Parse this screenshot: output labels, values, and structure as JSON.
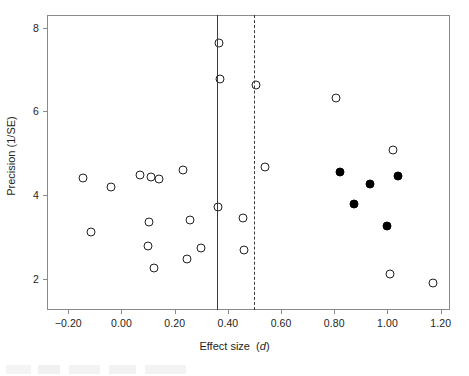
{
  "figure": {
    "kind": "funnel-plot",
    "axis_color": "#8a8a8a",
    "marker_color": "#231f20",
    "filled_marker_color": "#000000"
  },
  "chart_data": {
    "type": "scatter",
    "title": "",
    "xlabel": "Effect size (d)",
    "xlabel_plain": "Effect size",
    "xlabel_italic": "d",
    "ylabel": "Precision (1/SE)",
    "xlim": [
      -0.28,
      1.235
    ],
    "ylim": [
      1.25,
      8.3
    ],
    "xticks": [
      -0.2,
      0.0,
      0.2,
      0.4,
      0.6,
      0.8,
      1.0,
      1.2
    ],
    "xticklabels": [
      "−0.20",
      "0.00",
      "0.20",
      "0.40",
      "0.60",
      "0.80",
      "1.00",
      "1.20"
    ],
    "yticks": [
      2,
      4,
      6,
      8
    ],
    "yticklabels": [
      "2",
      "4",
      "6",
      "8"
    ],
    "grid": false,
    "legend": false,
    "reference_lines": [
      {
        "name": "observed-mean-line",
        "x": 0.36,
        "style": "solid"
      },
      {
        "name": "adjusted-mean-line",
        "x": 0.5,
        "style": "dashed"
      }
    ],
    "series": [
      {
        "name": "Observed studies",
        "marker": "open-circle",
        "points": [
          [
            -0.145,
            4.4
          ],
          [
            -0.115,
            3.11
          ],
          [
            -0.04,
            4.19
          ],
          [
            0.07,
            4.48
          ],
          [
            0.112,
            4.44
          ],
          [
            0.14,
            4.37
          ],
          [
            0.105,
            3.36
          ],
          [
            0.1,
            2.79
          ],
          [
            0.122,
            2.25
          ],
          [
            0.23,
            4.59
          ],
          [
            0.258,
            3.4
          ],
          [
            0.248,
            2.47
          ],
          [
            0.3,
            2.74
          ],
          [
            0.365,
            7.62
          ],
          [
            0.372,
            6.78
          ],
          [
            0.362,
            3.72
          ],
          [
            0.455,
            3.44
          ],
          [
            0.46,
            2.68
          ],
          [
            0.505,
            6.62
          ],
          [
            0.54,
            4.66
          ],
          [
            0.805,
            6.32
          ],
          [
            1.02,
            5.08
          ],
          [
            1.01,
            2.12
          ],
          [
            1.17,
            1.89
          ]
        ]
      },
      {
        "name": "Imputed studies",
        "marker": "filled-circle",
        "points": [
          [
            0.82,
            4.55
          ],
          [
            0.875,
            3.78
          ],
          [
            0.935,
            4.27
          ],
          [
            1.0,
            3.25
          ],
          [
            1.04,
            4.46
          ]
        ]
      }
    ]
  }
}
